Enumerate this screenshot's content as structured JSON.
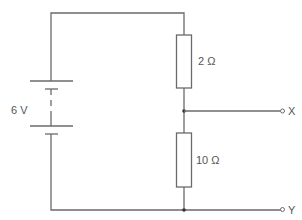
{
  "diagram": {
    "type": "circuit",
    "battery": {
      "label": "6 V"
    },
    "resistors": [
      {
        "id": "R1",
        "label": "2 Ω"
      },
      {
        "id": "R2",
        "label": "10 Ω"
      }
    ],
    "terminals": [
      {
        "id": "X",
        "label": "X"
      },
      {
        "id": "Y",
        "label": "Y"
      }
    ]
  },
  "colors": {
    "wire": "#6a6a6a",
    "text": "#555555"
  }
}
